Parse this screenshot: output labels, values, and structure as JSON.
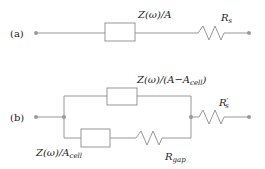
{
  "diagram": {
    "type": "equivalent-circuit",
    "colors": {
      "wire": "#8c8c8c",
      "node": "#9a9a9a",
      "text": "#222222",
      "background": "#ffffff"
    },
    "circuit_a": {
      "tag": "(a)",
      "impedance_label": {
        "main": "Z(ω)/A"
      },
      "resistor_label": {
        "main": "R",
        "sub": "s"
      }
    },
    "circuit_b": {
      "tag": "(b)",
      "top_impedance_label": {
        "main": "Z(ω)/(A−A",
        "sub": "cell",
        "tail": ")"
      },
      "bottom_impedance_label": {
        "main": "Z(ω)/A",
        "sub": "cell"
      },
      "gap_resistor_label": {
        "main": "R",
        "sub": "gap"
      },
      "series_resistor_label": {
        "main": "R",
        "prime": "′",
        "sub": "s"
      }
    }
  }
}
